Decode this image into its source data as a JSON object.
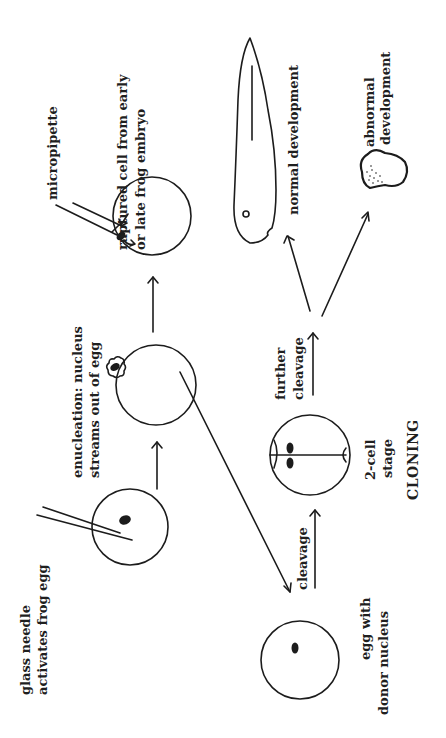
{
  "diagram": {
    "title": "CLONING",
    "orientation": "rotated 90° counter-clockwise",
    "stages": {
      "activation": {
        "label_line1": "glass needle",
        "label_line2": "activates frog egg"
      },
      "enucleation": {
        "label_line1": "enucleation: nucleus",
        "label_line2": "streams out of egg"
      },
      "injection": {
        "tool_label": "micropipette",
        "source_line1": "ruptured cell from early",
        "source_line2": "or late frog embryo"
      },
      "egg_donor": {
        "label_line1": "egg with",
        "label_line2": "donor nucleus"
      },
      "two_cell": {
        "label_line1": "2-cell",
        "label_line2": "stage"
      },
      "outcome_normal": {
        "label": "normal development"
      },
      "outcome_abnormal": {
        "label_line1": "abnormal",
        "label_line2": "development"
      }
    },
    "arrows": {
      "cleavage": "cleavage",
      "further_cleavage_line1": "further",
      "further_cleavage_line2": "cleavage"
    },
    "colors": {
      "ink": "#1c1c1c",
      "background": "#ffffff"
    }
  }
}
